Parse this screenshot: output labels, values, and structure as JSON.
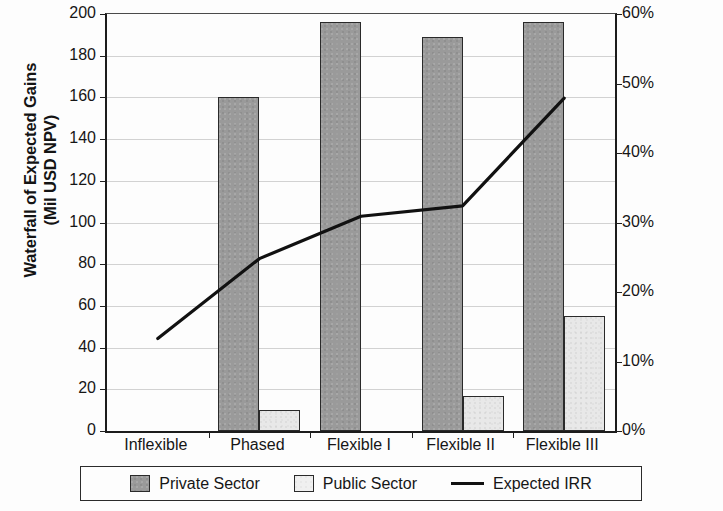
{
  "chart_data": {
    "type": "bar",
    "title": "",
    "subtitle": "",
    "xlabel": "",
    "ylabel": "Waterfall of Expected Gains (Mil USD NPV)",
    "ylabel_lines": [
      "Waterfall of Expected Gains",
      "(Mil USD NPV)"
    ],
    "y2label": "",
    "categories": [
      "Inflexible",
      "Phased",
      "Flexible I",
      "Flexible II",
      "Flexible III"
    ],
    "series": [
      {
        "name": "Private Sector",
        "type": "bar",
        "axis": "left",
        "color": "#9a9a9a",
        "values": [
          0,
          160,
          196,
          189,
          196
        ]
      },
      {
        "name": "Public Sector",
        "type": "bar",
        "axis": "left",
        "color": "#e8e8e8",
        "values": [
          0,
          10,
          0,
          17,
          55
        ]
      },
      {
        "name": "Expected IRR",
        "type": "line",
        "axis": "right",
        "color": "#111111",
        "values": [
          0.133,
          0.248,
          0.309,
          0.324,
          0.479
        ],
        "value_labels": [
          "13%",
          "25%",
          "31%",
          "32%",
          "48%"
        ]
      }
    ],
    "ylim": [
      0,
      200
    ],
    "yticks": [
      0,
      20,
      40,
      60,
      80,
      100,
      120,
      140,
      160,
      180,
      200
    ],
    "ytick_labels": [
      "0",
      "20",
      "40",
      "60",
      "80",
      "100",
      "120",
      "140",
      "160",
      "180",
      "200"
    ],
    "y2lim": [
      0,
      0.6
    ],
    "y2ticks": [
      0,
      0.1,
      0.2,
      0.3,
      0.4,
      0.5,
      0.6
    ],
    "y2tick_labels": [
      "0%",
      "10%",
      "20%",
      "30%",
      "40%",
      "50%",
      "60%"
    ],
    "grid": true,
    "grid_axis": "y",
    "legend": {
      "position": "bottom",
      "entries": [
        {
          "label": "Private Sector",
          "marker": "square-dark",
          "color": "#9a9a9a"
        },
        {
          "label": "Public Sector",
          "marker": "square-light",
          "color": "#e8e8e8"
        },
        {
          "label": "Expected IRR",
          "marker": "line",
          "color": "#111111"
        }
      ]
    }
  }
}
